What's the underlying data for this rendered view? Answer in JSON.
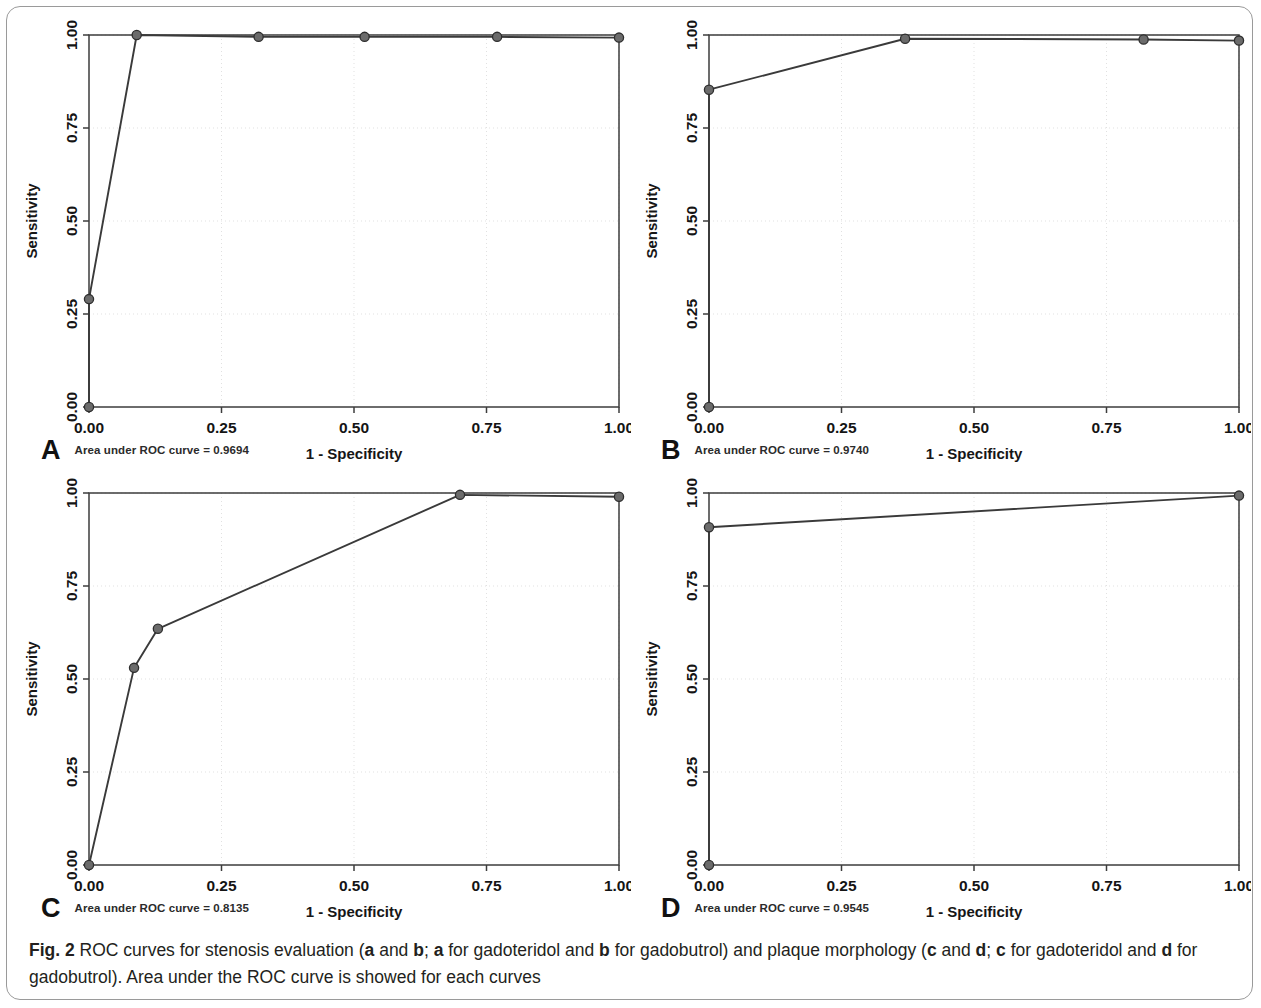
{
  "figure": {
    "caption_prefix": "Fig. 2",
    "caption_text": " ROC curves for stenosis evaluation (a and b; a for gadoteridol and b for gadobutrol) and plaque morphology (c and d; c for gadoteridol and d for gadobutrol). Area under the ROC curve is showed for each curves",
    "line_color": "#3a3a3a",
    "marker_color": "#6b6b6b",
    "marker_edge_color": "#2e2e2e",
    "grid_color": "#dedede",
    "axis_color": "#3d3d3d",
    "border_color": "#9a9a9a"
  },
  "panels": [
    {
      "letter": "A",
      "auc_label": "Area under ROC curve = 0.9694"
    },
    {
      "letter": "B",
      "auc_label": "Area under ROC curve = 0.9740"
    },
    {
      "letter": "C",
      "auc_label": "Area under ROC curve = 0.8135"
    },
    {
      "letter": "D",
      "auc_label": "Area under ROC curve = 0.9545"
    }
  ],
  "chart_data": [
    {
      "type": "line",
      "panel": "A",
      "title": "",
      "xlabel": "1 - Specificity",
      "ylabel": "Sensitivity",
      "xlim": [
        0,
        1
      ],
      "ylim": [
        0,
        1
      ],
      "xticks": [
        0.0,
        0.25,
        0.5,
        0.75,
        1.0
      ],
      "xtick_labels": [
        "0.00",
        "0.25",
        "0.50",
        "0.75",
        "1.00"
      ],
      "yticks": [
        0.0,
        0.25,
        0.5,
        0.75,
        1.0
      ],
      "ytick_labels": [
        "0.00",
        "0.25",
        "0.50",
        "0.75",
        "1.00"
      ],
      "grid": true,
      "legend": "none",
      "auc": 0.9694,
      "annotation": "Area under ROC curve = 0.9694",
      "reference_line": false,
      "x": [
        0.0,
        0.0,
        0.09,
        0.32,
        0.52,
        0.77,
        1.0
      ],
      "y": [
        0.0,
        0.29,
        1.0,
        0.995,
        0.995,
        0.995,
        0.993
      ],
      "markers": [
        {
          "x": 0.0,
          "y": 0.0
        },
        {
          "x": 0.0,
          "y": 0.29
        },
        {
          "x": 0.09,
          "y": 1.0
        },
        {
          "x": 0.32,
          "y": 0.995
        },
        {
          "x": 0.52,
          "y": 0.995
        },
        {
          "x": 0.77,
          "y": 0.995
        },
        {
          "x": 1.0,
          "y": 0.993
        }
      ]
    },
    {
      "type": "line",
      "panel": "B",
      "title": "",
      "xlabel": "1 - Specificity",
      "ylabel": "Sensitivity",
      "xlim": [
        0,
        1
      ],
      "ylim": [
        0,
        1
      ],
      "xticks": [
        0.0,
        0.25,
        0.5,
        0.75,
        1.0
      ],
      "xtick_labels": [
        "0.00",
        "0.25",
        "0.50",
        "0.75",
        "1.00"
      ],
      "yticks": [
        0.0,
        0.25,
        0.5,
        0.75,
        1.0
      ],
      "ytick_labels": [
        "0.00",
        "0.25",
        "0.50",
        "0.75",
        "1.00"
      ],
      "grid": true,
      "legend": "none",
      "auc": 0.974,
      "annotation": "Area under ROC curve = 0.9740",
      "reference_line": false,
      "x": [
        0.0,
        0.0,
        0.37,
        0.82,
        1.0
      ],
      "y": [
        0.0,
        0.853,
        0.99,
        0.988,
        0.985
      ],
      "markers": [
        {
          "x": 0.0,
          "y": 0.0
        },
        {
          "x": 0.0,
          "y": 0.853
        },
        {
          "x": 0.37,
          "y": 0.99
        },
        {
          "x": 0.82,
          "y": 0.988
        },
        {
          "x": 1.0,
          "y": 0.985
        }
      ]
    },
    {
      "type": "line",
      "panel": "C",
      "title": "",
      "xlabel": "1 - Specificity",
      "ylabel": "Sensitivity",
      "xlim": [
        0,
        1
      ],
      "ylim": [
        0,
        1
      ],
      "xticks": [
        0.0,
        0.25,
        0.5,
        0.75,
        1.0
      ],
      "xtick_labels": [
        "0.00",
        "0.25",
        "0.50",
        "0.75",
        "1.00"
      ],
      "yticks": [
        0.0,
        0.25,
        0.5,
        0.75,
        1.0
      ],
      "ytick_labels": [
        "0.00",
        "0.25",
        "0.50",
        "0.75",
        "1.00"
      ],
      "grid": true,
      "legend": "none",
      "auc": 0.8135,
      "annotation": "Area under ROC curve = 0.8135",
      "reference_line": false,
      "x": [
        0.0,
        0.085,
        0.13,
        0.7,
        1.0
      ],
      "y": [
        0.0,
        0.53,
        0.635,
        0.995,
        0.99
      ],
      "markers": [
        {
          "x": 0.0,
          "y": 0.0
        },
        {
          "x": 0.085,
          "y": 0.53
        },
        {
          "x": 0.13,
          "y": 0.635
        },
        {
          "x": 0.7,
          "y": 0.995
        },
        {
          "x": 1.0,
          "y": 0.99
        }
      ]
    },
    {
      "type": "line",
      "panel": "D",
      "title": "",
      "xlabel": "1 - Specificity",
      "ylabel": "Sensitivity",
      "xlim": [
        0,
        1
      ],
      "ylim": [
        0,
        1
      ],
      "xticks": [
        0.0,
        0.25,
        0.5,
        0.75,
        1.0
      ],
      "xtick_labels": [
        "0.00",
        "0.25",
        "0.50",
        "0.75",
        "1.00"
      ],
      "yticks": [
        0.0,
        0.25,
        0.5,
        0.75,
        1.0
      ],
      "ytick_labels": [
        "0.00",
        "0.25",
        "0.50",
        "0.75",
        "1.00"
      ],
      "grid": true,
      "legend": "none",
      "auc": 0.9545,
      "annotation": "Area under ROC curve = 0.9545",
      "reference_line": false,
      "x": [
        0.0,
        0.0,
        1.0
      ],
      "y": [
        0.0,
        0.908,
        0.993
      ],
      "markers": [
        {
          "x": 0.0,
          "y": 0.0
        },
        {
          "x": 0.0,
          "y": 0.908
        },
        {
          "x": 1.0,
          "y": 0.993
        }
      ]
    }
  ]
}
